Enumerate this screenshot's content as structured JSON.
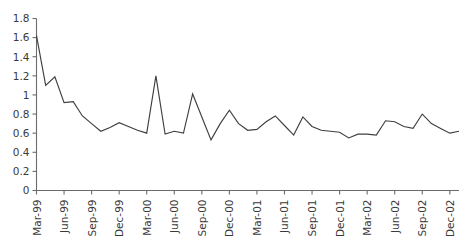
{
  "chart_data": {
    "type": "line",
    "title": "",
    "subtitle": "",
    "xlabel": "",
    "ylabel": "",
    "ylim": [
      0,
      1.8
    ],
    "y_ticks": [
      0,
      0.2,
      0.4,
      0.6,
      0.8,
      1,
      1.2,
      1.4,
      1.6,
      1.8
    ],
    "y_tick_labels": [
      "0",
      "0.2",
      "0.4",
      "0.6",
      "0.8",
      "1",
      "1.2",
      "1.4",
      "1.6",
      "1.8"
    ],
    "grid": false,
    "legend": null,
    "legend_position": "none",
    "x_tick_labels": [
      "Mar-99",
      "Jun-99",
      "Sep-99",
      "Dec-99",
      "Mar-00",
      "Jun-00",
      "Sep-00",
      "Dec-00",
      "Mar-01",
      "Jun-01",
      "Sep-01",
      "Dec-01",
      "Mar-02",
      "Jun-02",
      "Sep-02",
      "Dec-02"
    ],
    "x_tick_every_n_points": 3,
    "x": [
      "Mar-99",
      "Apr-99",
      "May-99",
      "Jun-99",
      "Jul-99",
      "Aug-99",
      "Sep-99",
      "Oct-99",
      "Nov-99",
      "Dec-99",
      "Jan-00",
      "Feb-00",
      "Mar-00",
      "Apr-00",
      "May-00",
      "Jun-00",
      "Jul-00",
      "Aug-00",
      "Sep-00",
      "Oct-00",
      "Nov-00",
      "Dec-00",
      "Jan-01",
      "Feb-01",
      "Mar-01",
      "Apr-01",
      "May-01",
      "Jun-01",
      "Jul-01",
      "Aug-01",
      "Sep-01",
      "Oct-01",
      "Nov-01",
      "Dec-01",
      "Jan-02",
      "Feb-02",
      "Mar-02",
      "Apr-02",
      "May-02",
      "Jun-02",
      "Jul-02",
      "Aug-02",
      "Sep-02",
      "Oct-02",
      "Nov-02",
      "Dec-02",
      "Jan-03"
    ],
    "values": [
      1.62,
      1.1,
      1.19,
      0.92,
      0.93,
      0.78,
      0.7,
      0.62,
      0.66,
      0.71,
      0.67,
      0.63,
      0.6,
      1.2,
      0.59,
      0.62,
      0.6,
      1.01,
      0.77,
      0.53,
      0.7,
      0.84,
      0.7,
      0.63,
      0.64,
      0.72,
      0.78,
      0.68,
      0.58,
      0.77,
      0.67,
      0.63,
      0.62,
      0.61,
      0.55,
      0.59,
      0.59,
      0.58,
      0.73,
      0.72,
      0.67,
      0.65,
      0.8,
      0.7,
      0.65,
      0.6,
      0.62
    ]
  },
  "series_note": {
    "max_value": 1.67,
    "max_label": "Jan-02",
    "min_value": 0.53,
    "min_label": "Oct-00",
    "start_value": 1.62,
    "start_label": "Mar-99",
    "end_value": 0.71,
    "end_label": "Jan-03"
  },
  "colors": {
    "line": "#3f3f3f",
    "axis": "#6b6b6b",
    "text": "#3a3a3a",
    "background": "#ffffff"
  }
}
